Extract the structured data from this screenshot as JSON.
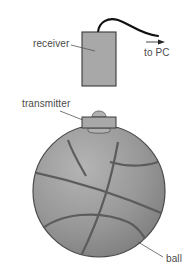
{
  "diagram": {
    "labels": {
      "receiver": "receiver",
      "to_pc": "to PC",
      "transmitter": "transmitter",
      "ball": "ball"
    },
    "colors": {
      "background": "#ffffff",
      "device_fill": "#a8a8a8",
      "device_stroke": "#3a3a3a",
      "ball_fill": "#8f8f8f",
      "ball_seams": "#5c5c5c",
      "cable": "#111111",
      "leader_lines": "#555555",
      "text": "#4a4a4a"
    }
  }
}
